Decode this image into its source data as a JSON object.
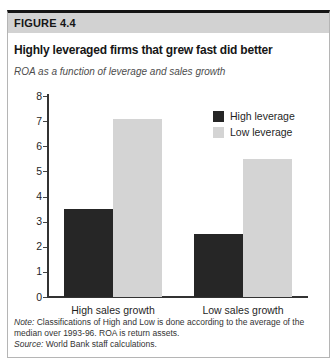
{
  "figure": {
    "label": "FIGURE 4.4",
    "title": "Highly leveraged firms that grew fast did better",
    "subtitle": "ROA as a function of leverage and sales growth"
  },
  "chart_data": {
    "type": "bar",
    "categories": [
      "High sales growth",
      "Low sales growth"
    ],
    "series": [
      {
        "name": "High leverage",
        "color": "#262626",
        "values": [
          3.5,
          2.5
        ]
      },
      {
        "name": "Low leverage",
        "color": "#d4d4d4",
        "values": [
          7.1,
          5.5
        ]
      }
    ],
    "title": "Highly leveraged firms that grew fast did better",
    "subtitle": "ROA as a function of leverage and sales growth",
    "xlabel": "",
    "ylabel": "",
    "ylim": [
      0,
      8
    ],
    "ytick_step": 1,
    "yticks": [
      0,
      1,
      2,
      3,
      4,
      5,
      6,
      7,
      8
    ],
    "grid": false,
    "legend_position": "top-right"
  },
  "notes": [
    {
      "label": "Note:",
      "text": "Classifications of High and Low is done according to the average of the median over 1993-96. ROA is return assets."
    },
    {
      "label": "Source:",
      "text": "World Bank staff calculations."
    }
  ],
  "colors": {
    "band_bg": "#d2d2d2",
    "top_rule": "#141414",
    "panel_border": "#b5b5b5",
    "axis": "#333333",
    "high_leverage": "#262626",
    "low_leverage": "#d4d4d4"
  }
}
